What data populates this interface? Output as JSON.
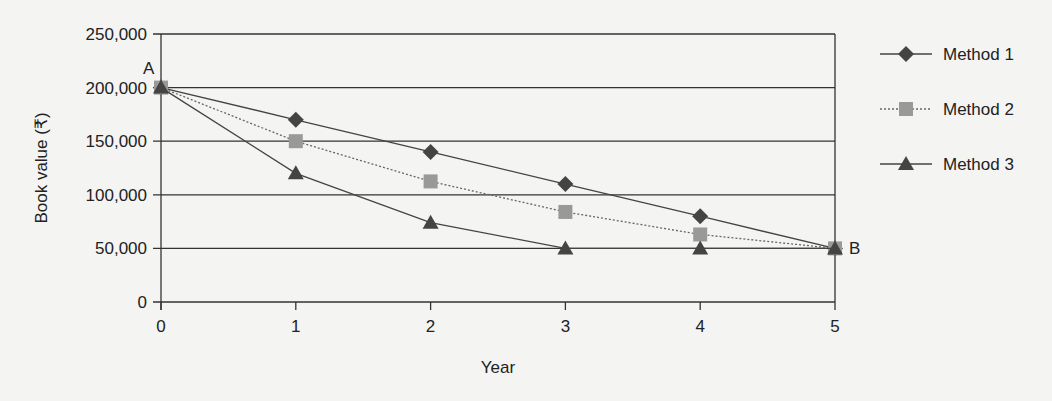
{
  "chart_data": {
    "type": "line",
    "title": "",
    "xlabel": "Year",
    "ylabel": "Book value (₹)",
    "x": [
      0,
      1,
      2,
      3,
      4,
      5
    ],
    "ylim": [
      0,
      250000
    ],
    "yticks": [
      0,
      50000,
      100000,
      150000,
      200000,
      250000
    ],
    "ytick_labels": [
      "0",
      "50,000",
      "100,000",
      "150,000",
      "200,000",
      "250,000"
    ],
    "xtick_labels": [
      "0",
      "1",
      "2",
      "3",
      "4",
      "5"
    ],
    "grid": "horizontal",
    "legend_position": "right",
    "series": [
      {
        "name": "Method 1",
        "marker": "diamond",
        "color": "#444444",
        "line": "solid",
        "values": [
          200000,
          170000,
          140000,
          110000,
          80000,
          50000
        ]
      },
      {
        "name": "Method 2",
        "marker": "square",
        "color": "#999999",
        "line": "dotted",
        "values": [
          200000,
          150000,
          112500,
          84000,
          63000,
          50000
        ]
      },
      {
        "name": "Method 3",
        "marker": "triangle",
        "color": "#444444",
        "line": "solid",
        "values": [
          200000,
          120000,
          74000,
          50000,
          50000,
          50000
        ]
      }
    ],
    "annotations": [
      {
        "text": "A",
        "x": 0,
        "y": 200000
      },
      {
        "text": "B",
        "x": 5,
        "y": 50000
      }
    ]
  }
}
